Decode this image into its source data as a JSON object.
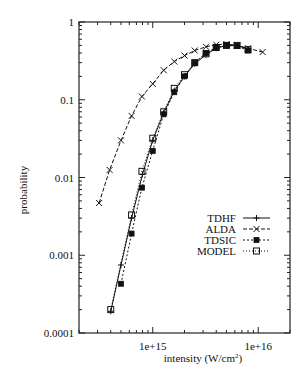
{
  "chart_data": {
    "type": "line",
    "title": "",
    "xlabel": "intensity (W/cm²)",
    "xlabel_base": "intensity (W/cm",
    "xlabel_sup": "2",
    "xlabel_tail": ")",
    "ylabel": "probability",
    "xscale": "log",
    "yscale": "log",
    "xlim": [
      200000000000000.0,
      2e+16
    ],
    "ylim": [
      0.0001,
      1
    ],
    "grid": false,
    "legend_position": "inside-right",
    "x_tick_labels": [
      {
        "value": 1000000000000000.0,
        "label": "1e+15"
      },
      {
        "value": 1e+16,
        "label": "1e+16"
      }
    ],
    "y_tick_labels": [
      {
        "value": 1,
        "label": "1"
      },
      {
        "value": 0.1,
        "label": "0.1"
      },
      {
        "value": 0.01,
        "label": "0.01"
      },
      {
        "value": 0.001,
        "label": "0.001"
      },
      {
        "value": 0.0001,
        "label": "0.0001"
      }
    ],
    "series": [
      {
        "name": "TDHF",
        "marker": "plus",
        "dash": "none",
        "color": "#111111",
        "x": [
          400000000000000.0,
          500000000000000.0,
          630000000000000.0,
          800000000000000.0,
          1000000000000000.0,
          1270000000000000.0,
          1600000000000000.0,
          2000000000000000.0,
          2500000000000000.0,
          3200000000000000.0,
          4000000000000000.0,
          5000000000000000.0,
          6300000000000000.0,
          8000000000000000.0
        ],
        "y": [
          0.00019,
          0.00075,
          0.003,
          0.011,
          0.03,
          0.068,
          0.13,
          0.2,
          0.29,
          0.38,
          0.46,
          0.5,
          0.5,
          0.45
        ]
      },
      {
        "name": "ALDA",
        "marker": "cross",
        "dash": "4,2",
        "color": "#111111",
        "x": [
          310000000000000.0,
          390000000000000.0,
          500000000000000.0,
          630000000000000.0,
          790000000000000.0,
          1000000000000000.0,
          1270000000000000.0,
          1600000000000000.0,
          2000000000000000.0,
          2500000000000000.0,
          3200000000000000.0,
          4000000000000000.0,
          5000000000000000.0,
          6300000000000000.0,
          8000000000000000.0,
          1.1e+16
        ],
        "y": [
          0.0047,
          0.0125,
          0.03,
          0.062,
          0.11,
          0.16,
          0.24,
          0.31,
          0.37,
          0.43,
          0.48,
          0.51,
          0.52,
          0.5,
          0.46,
          0.41
        ]
      },
      {
        "name": "TDSIC",
        "marker": "filled-square",
        "dash": "2,2",
        "color": "#111111",
        "x": [
          500000000000000.0,
          630000000000000.0,
          790000000000000.0,
          1000000000000000.0,
          1270000000000000.0,
          1600000000000000.0,
          2000000000000000.0,
          2500000000000000.0,
          3200000000000000.0,
          4000000000000000.0,
          5000000000000000.0,
          6300000000000000.0,
          8000000000000000.0
        ],
        "y": [
          0.00043,
          0.0019,
          0.0074,
          0.022,
          0.065,
          0.125,
          0.2,
          0.3,
          0.4,
          0.47,
          0.5,
          0.49,
          0.43
        ]
      },
      {
        "name": "MODEL",
        "marker": "open-square",
        "dash": "1,2",
        "color": "#111111",
        "x": [
          400000000000000.0,
          630000000000000.0,
          790000000000000.0,
          1000000000000000.0,
          1270000000000000.0,
          1600000000000000.0,
          2000000000000000.0,
          2500000000000000.0,
          3200000000000000.0,
          4000000000000000.0,
          5000000000000000.0,
          6300000000000000.0,
          8000000000000000.0
        ],
        "y": [
          0.0002,
          0.0033,
          0.012,
          0.032,
          0.07,
          0.14,
          0.21,
          0.3,
          0.39,
          0.47,
          0.5,
          0.5,
          0.44
        ]
      }
    ]
  }
}
